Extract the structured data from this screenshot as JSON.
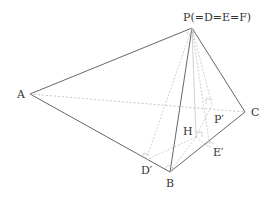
{
  "diagram": {
    "type": "pyramid-net-folding",
    "labels": {
      "P": "P(=D=E=F)",
      "A": "A",
      "B": "B",
      "C": "C",
      "D_prime": "D′",
      "E_prime": "E′",
      "H": "H",
      "P_prime": "P′"
    },
    "colors": {
      "edge": "#555555",
      "hidden": "#aaaaaa",
      "construction": "#bbbbbb"
    }
  }
}
